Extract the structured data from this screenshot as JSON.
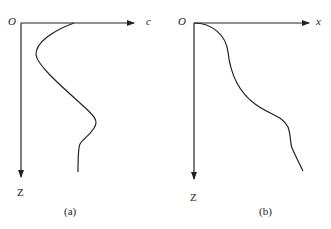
{
  "panels": [
    {
      "id": "a",
      "caption": "(a)",
      "origin_label": "O",
      "x_axis_label": "c",
      "z_axis_label": "Z",
      "curve_description": "Profile of c versus depth Z: starts on c-axis, bulges toward axis, then away, then near-vertical tail"
    },
    {
      "id": "b",
      "caption": "(b)",
      "origin_label": "O",
      "x_axis_label": "x",
      "z_axis_label": "Z",
      "curve_description": "Monotonic displacement curve from origin downward and rightward with inflection"
    }
  ],
  "colors": {
    "line": "#222222",
    "background": "#ffffff"
  }
}
